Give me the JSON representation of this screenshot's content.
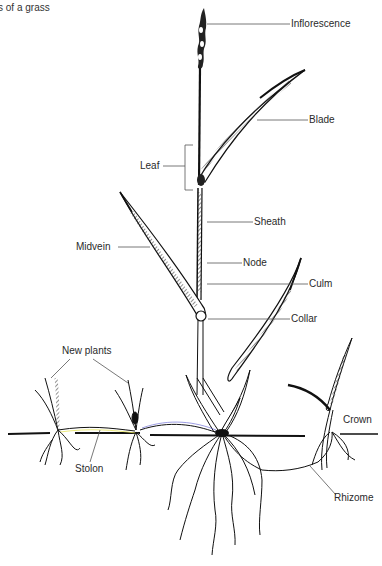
{
  "title": "s of a grass",
  "labels": {
    "inflorescence": "Inflorescence",
    "blade": "Blade",
    "leaf": "Leaf",
    "sheath": "Sheath",
    "midvein": "Midvein",
    "node": "Node",
    "culm": "Culm",
    "collar": "Collar",
    "new_plants": "New plants",
    "crown": "Crown",
    "stolon": "Stolon",
    "rhizome": "Rhizome"
  },
  "colors": {
    "ink": "#111111",
    "leader": "#555555",
    "crown_leader_start": "#6a5acd",
    "crown_leader_end": "#e8e86a",
    "stolon_highlight": "#e6e35a"
  }
}
